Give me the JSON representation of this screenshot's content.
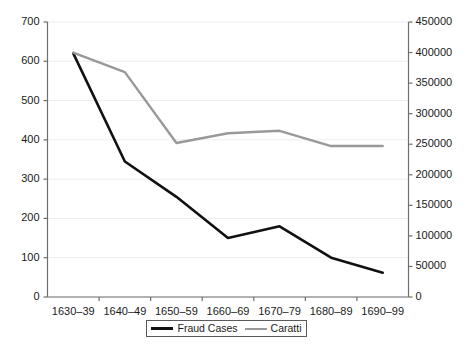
{
  "chart_data": {
    "type": "line",
    "title": "",
    "xlabel": "",
    "ylabel": "",
    "categories": [
      "1630–39",
      "1640–49",
      "1650–59",
      "1660–69",
      "1670–79",
      "1680–89",
      "1690–99"
    ],
    "grid": true,
    "legend_position": "bottom",
    "axes": {
      "left": {
        "label": "",
        "ylim": [
          0,
          700
        ],
        "tick_step": 100,
        "ticks": [
          "0",
          "100",
          "200",
          "300",
          "400",
          "500",
          "600",
          "700"
        ],
        "tick_values": [
          0,
          100,
          200,
          300,
          400,
          500,
          600,
          700
        ]
      },
      "right": {
        "label": "",
        "ylim": [
          0,
          450000
        ],
        "tick_step": 50000,
        "ticks": [
          "0",
          "50000",
          "100000",
          "150000",
          "200000",
          "250000",
          "300000",
          "350000",
          "400000",
          "450000"
        ],
        "tick_values": [
          0,
          50000,
          100000,
          150000,
          200000,
          250000,
          300000,
          350000,
          400000,
          450000
        ]
      }
    },
    "series": [
      {
        "name": "Fraud Cases",
        "axis": "left",
        "color": "#111111",
        "width": 2.6,
        "values": [
          620,
          345,
          255,
          150,
          180,
          100,
          62
        ]
      },
      {
        "name": "Caratti",
        "axis": "right",
        "color": "#999999",
        "width": 2.4,
        "values": [
          400000,
          368000,
          252000,
          268000,
          272000,
          247000,
          247000
        ]
      }
    ]
  },
  "legend": {
    "items": [
      {
        "label": "Fraud Cases",
        "color": "#111111"
      },
      {
        "label": "Caratti",
        "color": "#999999"
      }
    ]
  },
  "style": {
    "axis_color": "#6e6e6e",
    "grid_color": "#ededed",
    "text_color": "#1a1a1a",
    "background": "#ffffff"
  }
}
